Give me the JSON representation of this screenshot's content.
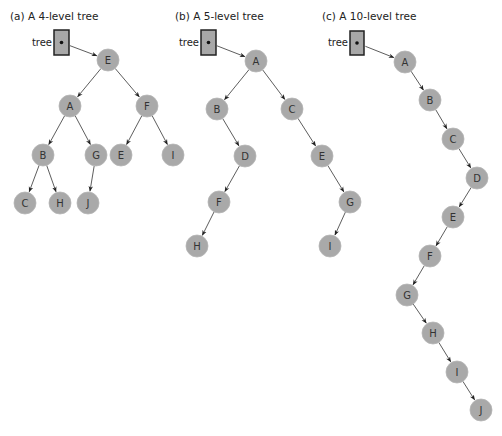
{
  "figure": {
    "background": "#ffffff",
    "node_color": "#a9a9a9",
    "pointer_label": "tree",
    "trees": [
      {
        "id": "a",
        "title": "(a) A 4-level tree",
        "title_pos": [
          10,
          20
        ],
        "pointer": {
          "x": 54,
          "y": 30,
          "w": 15,
          "h": 25
        },
        "nodes": [
          {
            "id": "E",
            "label": "E",
            "x": 108,
            "y": 60
          },
          {
            "id": "A",
            "label": "A",
            "x": 70,
            "y": 106
          },
          {
            "id": "F",
            "label": "F",
            "x": 147,
            "y": 106
          },
          {
            "id": "B",
            "label": "B",
            "x": 43,
            "y": 155
          },
          {
            "id": "G",
            "label": "G",
            "x": 96,
            "y": 155
          },
          {
            "id": "E2",
            "label": "E",
            "x": 121,
            "y": 155
          },
          {
            "id": "I",
            "label": "I",
            "x": 173,
            "y": 155
          },
          {
            "id": "C",
            "label": "C",
            "x": 25,
            "y": 203
          },
          {
            "id": "H",
            "label": "H",
            "x": 60,
            "y": 203
          },
          {
            "id": "J",
            "label": "J",
            "x": 88,
            "y": 203
          }
        ],
        "edges": [
          [
            "E",
            "A"
          ],
          [
            "E",
            "F"
          ],
          [
            "A",
            "B"
          ],
          [
            "A",
            "G"
          ],
          [
            "F",
            "E2"
          ],
          [
            "F",
            "I"
          ],
          [
            "B",
            "C"
          ],
          [
            "B",
            "H"
          ],
          [
            "G",
            "J"
          ]
        ],
        "root": "E"
      },
      {
        "id": "b",
        "title": "(b) A 5-level tree",
        "title_pos": [
          175,
          20
        ],
        "pointer": {
          "x": 201,
          "y": 30,
          "w": 15,
          "h": 25
        },
        "nodes": [
          {
            "id": "A",
            "label": "A",
            "x": 256,
            "y": 61
          },
          {
            "id": "B",
            "label": "B",
            "x": 217,
            "y": 109
          },
          {
            "id": "C",
            "label": "C",
            "x": 292,
            "y": 109
          },
          {
            "id": "D",
            "label": "D",
            "x": 245,
            "y": 156
          },
          {
            "id": "E",
            "label": "E",
            "x": 322,
            "y": 156
          },
          {
            "id": "F",
            "label": "F",
            "x": 219,
            "y": 202
          },
          {
            "id": "G",
            "label": "G",
            "x": 350,
            "y": 202
          },
          {
            "id": "H",
            "label": "H",
            "x": 197,
            "y": 246
          },
          {
            "id": "I",
            "label": "I",
            "x": 330,
            "y": 246
          }
        ],
        "edges": [
          [
            "A",
            "B"
          ],
          [
            "A",
            "C"
          ],
          [
            "B",
            "D"
          ],
          [
            "C",
            "E"
          ],
          [
            "D",
            "F"
          ],
          [
            "E",
            "G"
          ],
          [
            "F",
            "H"
          ],
          [
            "G",
            "I"
          ]
        ],
        "root": "A"
      },
      {
        "id": "c",
        "title": "(c) A 10-level tree",
        "title_pos": [
          322,
          20
        ],
        "pointer": {
          "x": 350,
          "y": 31,
          "w": 14,
          "h": 24
        },
        "nodes": [
          {
            "id": "A",
            "label": "A",
            "x": 405,
            "y": 62
          },
          {
            "id": "B",
            "label": "B",
            "x": 430,
            "y": 100
          },
          {
            "id": "C",
            "label": "C",
            "x": 453,
            "y": 139
          },
          {
            "id": "D",
            "label": "D",
            "x": 477,
            "y": 178
          },
          {
            "id": "E",
            "label": "E",
            "x": 453,
            "y": 217
          },
          {
            "id": "F",
            "label": "F",
            "x": 430,
            "y": 256
          },
          {
            "id": "G",
            "label": "G",
            "x": 407,
            "y": 295
          },
          {
            "id": "H",
            "label": "H",
            "x": 433,
            "y": 333
          },
          {
            "id": "I",
            "label": "I",
            "x": 457,
            "y": 372
          },
          {
            "id": "J",
            "label": "J",
            "x": 481,
            "y": 410
          }
        ],
        "edges": [
          [
            "A",
            "B"
          ],
          [
            "B",
            "C"
          ],
          [
            "C",
            "D"
          ],
          [
            "D",
            "E"
          ],
          [
            "E",
            "F"
          ],
          [
            "F",
            "G"
          ],
          [
            "G",
            "H"
          ],
          [
            "H",
            "I"
          ],
          [
            "I",
            "J"
          ]
        ],
        "root": "A"
      }
    ]
  }
}
